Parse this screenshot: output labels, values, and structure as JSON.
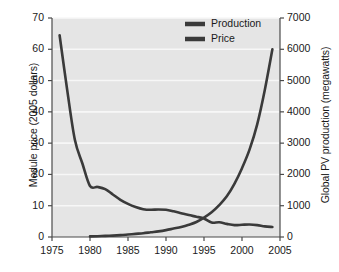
{
  "chart_data": {
    "type": "line",
    "title": "",
    "subtitle": "",
    "xlabel": "",
    "ylabel": "Module price (2005 dollars)",
    "ylabel_right": "Global PV production (megawatts)",
    "xlim": [
      1975,
      2005
    ],
    "ylim": [
      0,
      70
    ],
    "ylim_right": [
      0,
      7000
    ],
    "xticks": [
      1975,
      1980,
      1985,
      1990,
      1995,
      2000,
      2005
    ],
    "xticklabels": [
      "1975",
      "1980",
      "1985",
      "1990",
      "1995",
      "2000",
      "2005"
    ],
    "yticks": [
      0,
      10,
      20,
      30,
      40,
      50,
      60,
      70
    ],
    "yticklabels": [
      "0",
      "10",
      "20",
      "30",
      "40",
      "50",
      "60",
      "70"
    ],
    "yticks_right": [
      0,
      1000,
      2000,
      3000,
      4000,
      5000,
      6000,
      7000
    ],
    "yticklabels_right": [
      "0",
      "1000",
      "2000",
      "3000",
      "4000",
      "5000",
      "6000",
      "7000"
    ],
    "grid": true,
    "grid_orientation": "horizontal",
    "grid_color": "#f7f7f7",
    "plot_background": "#e5e5e5",
    "figure_background": "#ffffff",
    "legend_position": "top-center",
    "legend": [
      "Production",
      "Price"
    ],
    "series": [
      {
        "name": "Production",
        "axis": "right",
        "color": "#3a3a3a",
        "units": "megawatts",
        "x": [
          1980,
          1981,
          1982,
          1983,
          1984,
          1985,
          1986,
          1987,
          1988,
          1989,
          1990,
          1991,
          1992,
          1993,
          1994,
          1995,
          1996,
          1997,
          1998,
          1999,
          2000,
          2001,
          2002,
          2003,
          2004
        ],
        "values": [
          20,
          25,
          35,
          45,
          60,
          80,
          100,
          120,
          150,
          180,
          220,
          270,
          320,
          390,
          480,
          620,
          790,
          1020,
          1300,
          1700,
          2200,
          2800,
          3600,
          4700,
          6000
        ]
      },
      {
        "name": "Price",
        "axis": "left",
        "color": "#3a3a3a",
        "units": "2005 dollars per watt",
        "x": [
          1976,
          1977,
          1978,
          1979,
          1980,
          1981,
          1982,
          1983,
          1984,
          1985,
          1986,
          1987,
          1988,
          1989,
          1990,
          1991,
          1992,
          1993,
          1994,
          1995,
          1996,
          1997,
          1998,
          1999,
          2000,
          2001,
          2002,
          2003,
          2004
        ],
        "values": [
          64.5,
          47.0,
          31.2,
          23.5,
          16.3,
          16.0,
          15.3,
          13.6,
          11.9,
          10.6,
          9.6,
          8.9,
          8.7,
          8.8,
          8.7,
          8.2,
          7.6,
          7.0,
          6.5,
          5.9,
          4.6,
          4.7,
          4.2,
          3.8,
          3.9,
          4.0,
          3.8,
          3.4,
          3.2
        ]
      }
    ]
  },
  "legend_items": [
    {
      "label": "Production",
      "swatch_color": "#3a3a3a"
    },
    {
      "label": "Price",
      "swatch_color": "#3a3a3a"
    }
  ],
  "axes": {
    "left_title": "Module price (2005 dollars)",
    "right_title": "Global PV production (megawatts)"
  }
}
